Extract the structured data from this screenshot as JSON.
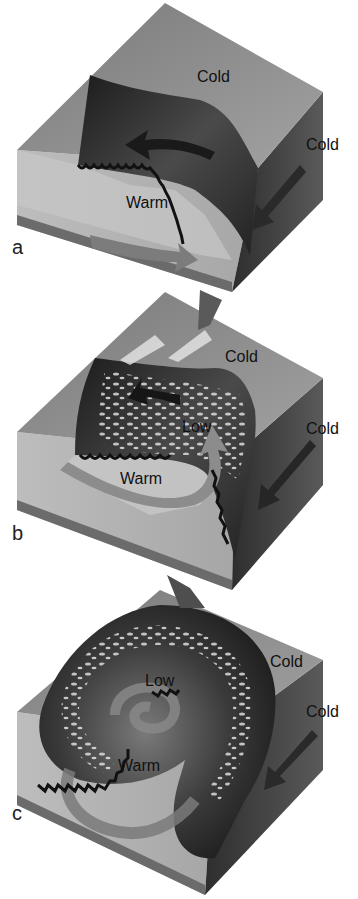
{
  "figure": {
    "colors": {
      "background": "#ffffff",
      "top_face": "#8e8e8e",
      "left_face": "#b4b4b4",
      "right_face": "#3e3e3e",
      "front_surface": "#2a2a2a",
      "warm_arrow": "#8a8a8a",
      "cloud": "#e8e8e8",
      "front_teeth": "#111111"
    },
    "panels": [
      {
        "id": "a",
        "letter": "a",
        "labels": {
          "cold_top": "Cold",
          "cold_side": "Cold",
          "warm": "Warm"
        }
      },
      {
        "id": "b",
        "letter": "b",
        "labels": {
          "cold_top": "Cold",
          "cold_side": "Cold",
          "low": "Low",
          "warm": "Warm"
        }
      },
      {
        "id": "c",
        "letter": "c",
        "labels": {
          "cold_top": "Cold",
          "cold_side": "Cold",
          "low": "Low",
          "warm": "Warm"
        }
      }
    ]
  }
}
